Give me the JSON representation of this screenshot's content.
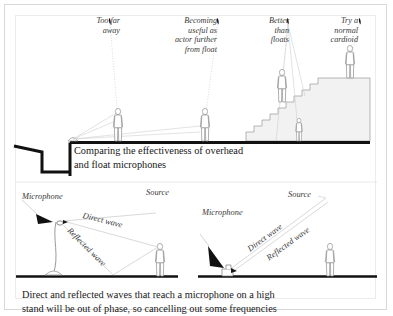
{
  "figure": {
    "top_panel": {
      "annotations": [
        {
          "id": "too-far-away",
          "text": "Too far\naway"
        },
        {
          "id": "becoming-useful",
          "text": "Becoming\nuseful as\nactor further\nfrom float"
        },
        {
          "id": "better-than-floats",
          "text": "Better\nthan\nfloats"
        },
        {
          "id": "try-a-normal-cardioid",
          "text": "Try a\nnormal\ncardioid"
        }
      ],
      "caption": "Comparing the effectiveness of overhead\nand float microphones"
    },
    "bottom_panel": {
      "left_diagram": {
        "microphone_label": "Microphone",
        "source_label": "Source",
        "direct_wave_label": "Direct wave",
        "reflected_wave_label": "Reflected wave"
      },
      "right_diagram": {
        "microphone_label": "Microphone",
        "source_label": "Source",
        "direct_wave_label": "Direct wave",
        "reflected_wave_label": "Reflected wave"
      },
      "caption": "Direct and reflected waves that reach a microphone on a high\nstand will be out of phase, so cancelling out some frequencies"
    },
    "colors": {
      "ink": "#171717",
      "line": "#9a9a9a",
      "ray": "#c9c9c9",
      "fill": "#f2f2f2",
      "frame": "#d8d8d8",
      "label": "#3a3a3a"
    }
  }
}
